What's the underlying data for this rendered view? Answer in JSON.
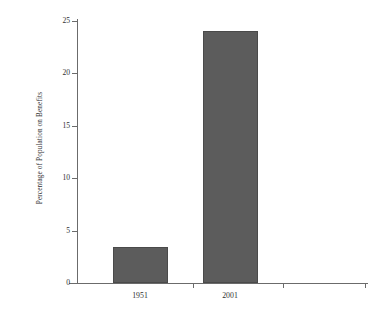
{
  "chart_data": {
    "type": "bar",
    "title": "",
    "subtitle": "",
    "xlabel": "",
    "ylabel": "Percentage of Population on Benefits",
    "categories": [
      "1951",
      "2001"
    ],
    "values": [
      3.4,
      24.0
    ],
    "series": [
      {
        "name": "Percentage of Population on Benefits",
        "values": [
          3.4,
          24.0
        ]
      }
    ],
    "ylim": [
      0,
      25
    ],
    "yticks": [
      0,
      5,
      10,
      15,
      20,
      25
    ],
    "ytick_labels": [
      "0",
      "5",
      "10",
      "15",
      "20",
      "25"
    ],
    "xtick_labels": [
      "1951",
      "2001"
    ],
    "grid": false,
    "legend": false,
    "legend_position": "none",
    "bar_color": "#5c5c5c",
    "axis_color": "#6b6b6b",
    "text_color": "#2f2f2f",
    "background": "#ffffff"
  }
}
